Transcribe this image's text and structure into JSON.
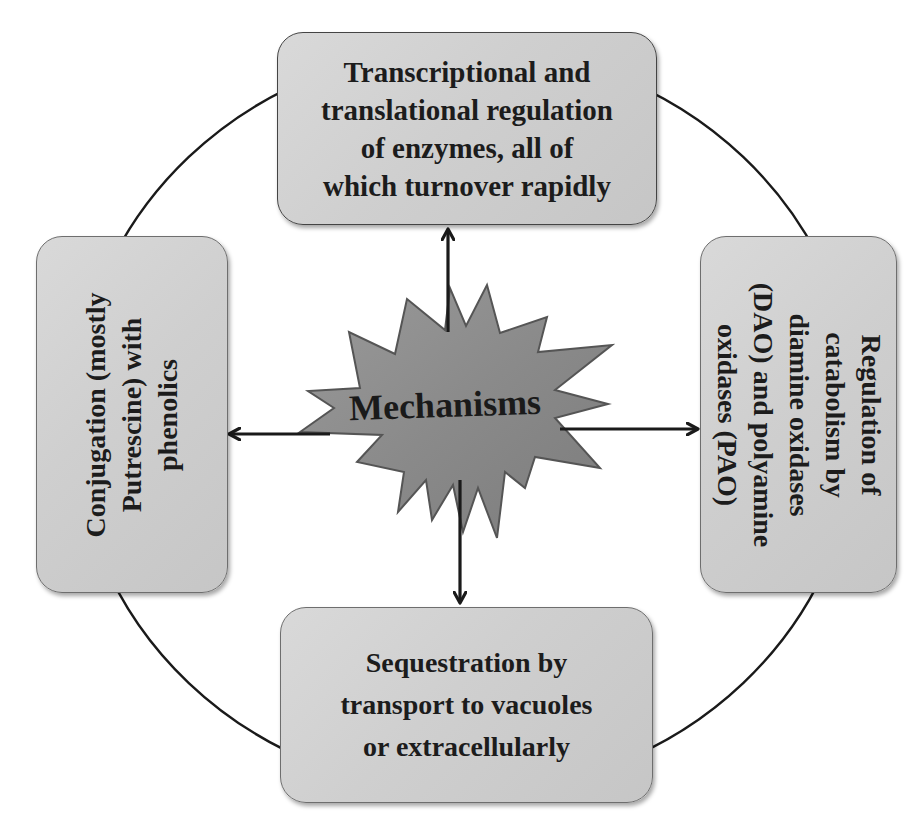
{
  "diagram": {
    "type": "radial-mechanism-diagram",
    "center": {
      "label": "Mechanisms",
      "shape": "starburst",
      "fill": "#8c8c8c",
      "outline": "#5a5a5a"
    },
    "nodes": [
      {
        "id": "top",
        "position": "top",
        "text": "Transcriptional and\ntranslational regulation\nof enzymes, all of\nwhich turnover rapidly",
        "orientation": "horizontal"
      },
      {
        "id": "right",
        "position": "right",
        "text": "Regulation of\ncatabolism by\ndiamine oxidases\n(DAO) and polyamine\noxidases (PAO)",
        "orientation": "rotated-90-clockwise"
      },
      {
        "id": "bottom",
        "position": "bottom",
        "text": "Sequestration by\ntransport to vacuoles\nor extracellularly",
        "orientation": "horizontal"
      },
      {
        "id": "left",
        "position": "left",
        "text": "Conjugation (mostly\nPutrescine) with\nphenolics",
        "orientation": "rotated-90-counterclockwise"
      }
    ],
    "edges": [
      {
        "from": "center",
        "to": "top",
        "style": "arrow"
      },
      {
        "from": "center",
        "to": "right",
        "style": "arrow"
      },
      {
        "from": "center",
        "to": "bottom",
        "style": "arrow"
      },
      {
        "from": "center",
        "to": "left",
        "style": "arrow"
      }
    ],
    "ring": {
      "style": "circle connecting all four boxes",
      "color": "#1a1a1a"
    },
    "colors": {
      "box_fill": "#d2d2d2",
      "box_border": "#6e6e6e",
      "text": "#1c1c1c",
      "arrow": "#1a1a1a"
    }
  }
}
